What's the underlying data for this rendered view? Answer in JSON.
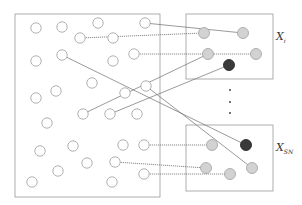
{
  "diagram": {
    "type": "sampling-mapping",
    "population_box": {
      "x": 15,
      "y": 14,
      "w": 145,
      "h": 183
    },
    "subsets": [
      {
        "label": "X",
        "subscript": "i",
        "box": {
          "x": 186,
          "y": 14,
          "w": 87,
          "h": 65
        },
        "label_pos": {
          "x": 276,
          "y": 36
        }
      },
      {
        "label": "X",
        "subscript": "SN",
        "box": {
          "x": 186,
          "y": 125,
          "w": 87,
          "h": 66
        },
        "label_pos": {
          "x": 276,
          "y": 147
        }
      }
    ],
    "ellipsis_dots": [
      [
        230,
        90
      ],
      [
        230,
        102
      ],
      [
        230,
        113
      ]
    ],
    "hollow_nodes": [
      [
        36,
        28
      ],
      [
        62,
        27
      ],
      [
        98,
        23
      ],
      [
        145,
        23
      ],
      [
        80,
        38
      ],
      [
        113,
        38
      ],
      [
        62,
        55
      ],
      [
        36,
        61
      ],
      [
        113,
        61
      ],
      [
        134,
        54
      ],
      [
        92,
        83
      ],
      [
        36,
        98
      ],
      [
        56,
        91
      ],
      [
        125,
        93
      ],
      [
        146,
        86
      ],
      [
        83,
        114
      ],
      [
        110,
        114
      ],
      [
        137,
        114
      ],
      [
        47,
        123
      ],
      [
        40,
        151
      ],
      [
        73,
        146
      ],
      [
        123,
        145
      ],
      [
        144,
        145
      ],
      [
        58,
        171
      ],
      [
        87,
        163
      ],
      [
        115,
        162
      ],
      [
        32,
        182
      ],
      [
        112,
        182
      ],
      [
        144,
        174
      ]
    ],
    "gray_nodes": [
      [
        204,
        33
      ],
      [
        243,
        33
      ],
      [
        208,
        54
      ],
      [
        256,
        54
      ],
      [
        212,
        145
      ],
      [
        206,
        168
      ],
      [
        252,
        168
      ],
      [
        230,
        174
      ]
    ],
    "dark_nodes": [
      [
        229,
        65
      ],
      [
        246,
        145
      ]
    ],
    "edges": [
      {
        "from": [
          145,
          23
        ],
        "to": [
          243,
          33
        ],
        "style": "solid"
      },
      {
        "from": [
          80,
          38
        ],
        "to": [
          204,
          33
        ],
        "style": "dotted"
      },
      {
        "from": [
          134,
          54
        ],
        "to": [
          256,
          54
        ],
        "style": "dotted"
      },
      {
        "from": [
          83,
          114
        ],
        "to": [
          208,
          54
        ],
        "style": "solid"
      },
      {
        "from": [
          110,
          114
        ],
        "to": [
          229,
          65
        ],
        "style": "solid"
      },
      {
        "from": [
          62,
          55
        ],
        "to": [
          246,
          145
        ],
        "style": "solid"
      },
      {
        "from": [
          146,
          86
        ],
        "to": [
          252,
          168
        ],
        "style": "solid"
      },
      {
        "from": [
          144,
          145
        ],
        "to": [
          212,
          145
        ],
        "style": "dotted"
      },
      {
        "from": [
          115,
          162
        ],
        "to": [
          206,
          168
        ],
        "style": "dotted"
      },
      {
        "from": [
          144,
          174
        ],
        "to": [
          230,
          174
        ],
        "style": "dotted"
      }
    ]
  },
  "labels": {
    "xi_main": "X",
    "xi_sub": "i",
    "xsn_main": "X",
    "xsn_sub": "SN"
  }
}
